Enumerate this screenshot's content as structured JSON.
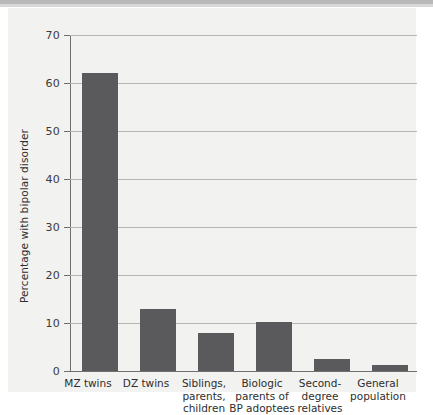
{
  "chart_data": {
    "type": "bar",
    "title": "",
    "subtitle": "",
    "xlabel": "",
    "ylabel": "Percentage with bipolar disorder",
    "ylim": [
      0,
      70
    ],
    "yticks": [
      0,
      10,
      20,
      30,
      40,
      50,
      60,
      70
    ],
    "ytick_labels": [
      "0",
      "10",
      "20",
      "30",
      "40",
      "50",
      "60",
      "70"
    ],
    "grid": true,
    "legend": "none",
    "bar_color": "#5a5a5c",
    "plot_background": "#f2f2f0",
    "gridline_color": "#b5b5b3",
    "axis_color": "#6f6f6f",
    "categories": [
      "MZ twins",
      "DZ twins",
      "Siblings, parents, children",
      "Biologic parents of BP adoptees",
      "Second-degree relatives",
      "General population"
    ],
    "category_lines": [
      [
        "MZ twins"
      ],
      [
        "DZ twins"
      ],
      [
        "Siblings,",
        "parents,",
        "children"
      ],
      [
        "Biologic",
        "parents of",
        "BP adoptees"
      ],
      [
        "Second-",
        "degree",
        "relatives"
      ],
      [
        "General",
        "population"
      ]
    ],
    "values": [
      62,
      13,
      8,
      10.2,
      2.5,
      1.2
    ],
    "units": "percent"
  }
}
